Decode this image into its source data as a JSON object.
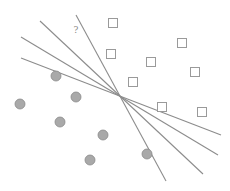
{
  "diagram": {
    "title": "",
    "annotation": {
      "text": "?",
      "x": 76,
      "y": 33
    },
    "colors": {
      "line": "#8c8c8c",
      "circle_fill": "#a9a9a9",
      "circle_stroke": "#8a8a8a",
      "square_stroke": "#9a9a9a",
      "square_fill": "#ffffff",
      "annotation": "#888888"
    },
    "lines": [
      {
        "id": "hyperplane-1",
        "x1": 76,
        "y1": 15,
        "x2": 166,
        "y2": 181
      },
      {
        "id": "hyperplane-2",
        "x1": 40,
        "y1": 21,
        "x2": 203,
        "y2": 174
      },
      {
        "id": "hyperplane-3",
        "x1": 21,
        "y1": 37,
        "x2": 218,
        "y2": 155
      },
      {
        "id": "hyperplane-4",
        "x1": 21,
        "y1": 58,
        "x2": 221,
        "y2": 135
      }
    ],
    "circles": [
      {
        "cx": 56,
        "cy": 76
      },
      {
        "cx": 76,
        "cy": 97
      },
      {
        "cx": 20,
        "cy": 104
      },
      {
        "cx": 60,
        "cy": 122
      },
      {
        "cx": 103,
        "cy": 135
      },
      {
        "cx": 90,
        "cy": 160
      },
      {
        "cx": 147,
        "cy": 154
      }
    ],
    "squares": [
      {
        "cx": 113,
        "cy": 23
      },
      {
        "cx": 111,
        "cy": 54
      },
      {
        "cx": 151,
        "cy": 62
      },
      {
        "cx": 182,
        "cy": 43
      },
      {
        "cx": 195,
        "cy": 72
      },
      {
        "cx": 133,
        "cy": 82
      },
      {
        "cx": 162,
        "cy": 107
      },
      {
        "cx": 202,
        "cy": 112
      }
    ],
    "intersection": {
      "x": 121,
      "y": 97
    }
  }
}
